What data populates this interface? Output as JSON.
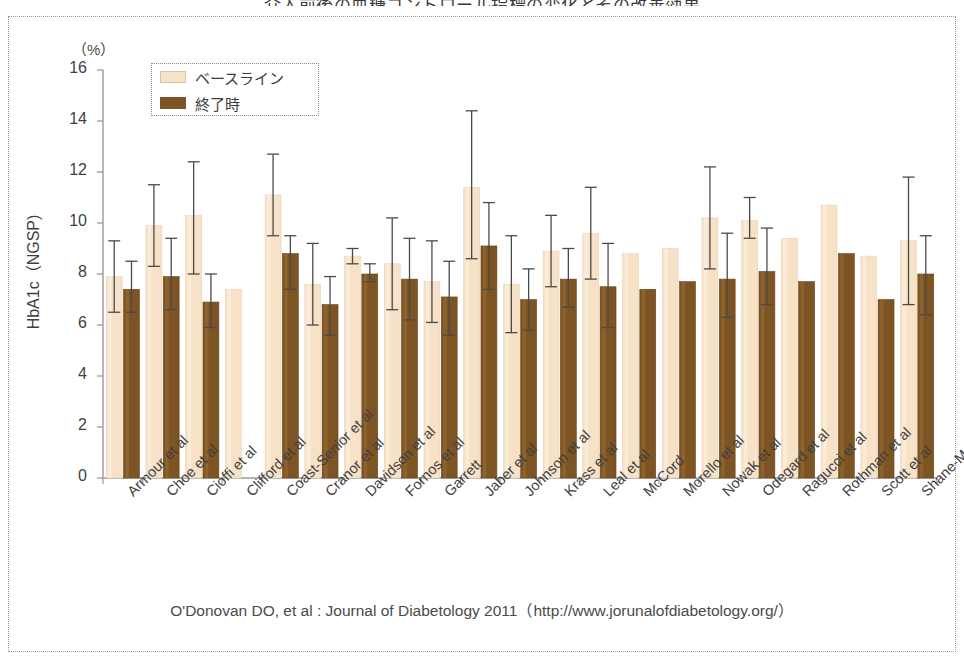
{
  "figure": {
    "cut_top_text": "介入前後の血糖コントロール指標の変化とその改善効果",
    "caption": "O'Donovan DO, et al : Journal of Diabetology 2011（http://www.jorunalofdiabetology.org/）",
    "unit_label": "（%）",
    "colors": {
      "baseline": "#f7e2c8",
      "endpoint": "#7d5423",
      "axis": "#9a9a9a",
      "error_bar": "#4a4a4a",
      "text": "#3f3f3f",
      "frame": "#999999"
    }
  },
  "chart_data": {
    "type": "bar",
    "title": "",
    "subtitle": "",
    "xlabel": "",
    "ylabel": "HbA1c（NGSP)",
    "unit": "%",
    "ylim": [
      0,
      16
    ],
    "yticks": [
      0,
      2,
      4,
      6,
      8,
      10,
      12,
      14,
      16
    ],
    "ytick_labels": [
      "0",
      "2",
      "4",
      "6",
      "8",
      "10",
      "12",
      "14",
      "16"
    ],
    "grid": false,
    "legend_position": "upper-left-inside",
    "error_bars": "yes",
    "categories": [
      "Armour et al",
      "Choe et al",
      "Cioffi et al",
      "Clifford et al",
      "Coast-Senior et al",
      "Cranor et al",
      "Davidson et al",
      "Fornos et al",
      "Garrett",
      "Jaber et al",
      "Johnson et al",
      "Krass et al",
      "Leal et al",
      "McCord",
      "Morello et al",
      "Nowak et al",
      "Odegard et al",
      "Ragucci et al",
      "Rothman et al",
      "Scott et al",
      "Shane-McWhorter"
    ],
    "series": [
      {
        "name": "ベースライン",
        "color": "#f7e2c8",
        "values": [
          7.9,
          9.9,
          10.3,
          7.4,
          11.1,
          7.6,
          8.7,
          8.4,
          7.7,
          11.4,
          7.6,
          8.9,
          9.6,
          8.8,
          9.0,
          10.2,
          10.1,
          9.4,
          10.7,
          8.7,
          9.3
        ],
        "err_low": [
          6.5,
          8.3,
          8.0,
          null,
          9.5,
          6.0,
          8.4,
          6.6,
          6.1,
          8.6,
          5.7,
          7.5,
          7.8,
          null,
          null,
          8.2,
          9.4,
          null,
          null,
          null,
          6.8
        ],
        "err_high": [
          9.3,
          11.5,
          12.4,
          null,
          12.7,
          9.2,
          9.0,
          10.2,
          9.3,
          14.4,
          9.5,
          10.3,
          11.4,
          null,
          null,
          12.2,
          11.0,
          null,
          null,
          null,
          11.8
        ]
      },
      {
        "name": "終了時",
        "color": "#7d5423",
        "values": [
          7.4,
          7.9,
          6.9,
          null,
          8.8,
          6.8,
          8.0,
          7.8,
          7.1,
          9.1,
          7.0,
          7.8,
          7.5,
          7.4,
          7.7,
          7.8,
          8.1,
          7.7,
          8.8,
          7.0,
          8.0
        ],
        "err_low": [
          6.5,
          6.6,
          5.9,
          null,
          7.4,
          5.6,
          7.7,
          6.2,
          5.6,
          7.4,
          5.8,
          6.7,
          5.9,
          null,
          null,
          6.3,
          6.8,
          null,
          null,
          null,
          6.4
        ],
        "err_high": [
          8.5,
          9.4,
          8.0,
          null,
          9.5,
          7.9,
          8.4,
          9.4,
          8.5,
          10.8,
          8.2,
          9.0,
          9.2,
          null,
          null,
          9.6,
          9.8,
          null,
          null,
          null,
          9.5
        ]
      }
    ],
    "legend": [
      "ベースライン",
      "終了時"
    ]
  }
}
